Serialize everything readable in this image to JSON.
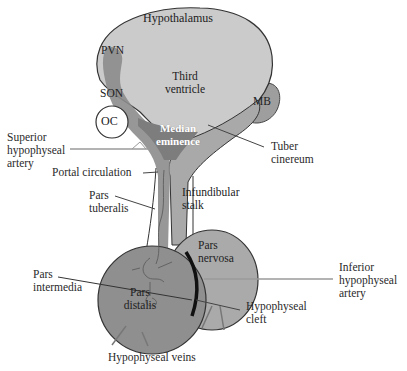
{
  "diagram": {
    "colors": {
      "hypothalamus_fill": "#c9c9c9",
      "stalk_fill": "#a8a8a8",
      "neuron_tract": "#8a8a8a",
      "pars_distalis_fill": "#8f8f8f",
      "pars_nervosa_fill": "#a9a9a9",
      "outline": "#333333",
      "leader_line": "#555555",
      "artery_line": "#9a9a9a"
    },
    "structures": {
      "hypothalamus": "Hypothalamus",
      "pvn": "PVN",
      "son": "SON",
      "third_ventricle_line1": "Third",
      "third_ventricle_line2": "ventricle",
      "oc": "OC",
      "mb": "MB",
      "median_eminence_line1": "Median",
      "median_eminence_line2": "eminence",
      "infundibular_stalk_line1": "Infundibular",
      "infundibular_stalk_line2": "stalk",
      "pars_nervosa_line1": "Pars",
      "pars_nervosa_line2": "nervosa",
      "pars_distalis_line1": "Pars",
      "pars_distalis_line2": "distalis"
    },
    "callouts": {
      "superior_hypophyseal_artery": [
        "Superior",
        "hypophyseal",
        "artery"
      ],
      "tuber_cinereum": [
        "Tuber",
        "cinereum"
      ],
      "portal_circulation": "Portal circulation",
      "pars_tuberalis": [
        "Pars",
        "tuberalis"
      ],
      "pars_intermedia": [
        "Pars",
        "intermedia"
      ],
      "inferior_hypophyseal_artery": [
        "Inferior",
        "hypophyseal",
        "artery"
      ],
      "hypophyseal_cleft": [
        "Hypophyseal",
        "cleft"
      ],
      "hypophyseal_veins": "Hypophyseal veins"
    }
  }
}
